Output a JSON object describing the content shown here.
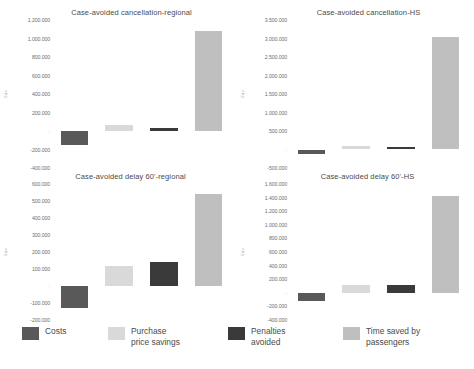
{
  "figure": {
    "ylabel": "Euro",
    "series_names": [
      "Costs",
      "Purchase price savings",
      "Penalties avoided",
      "Time saved by passengers"
    ],
    "colors": {
      "costs": "#595959",
      "purchase_price_savings": "#d9d9d9",
      "penalties_avoided": "#3a3a3a",
      "time_saved_by_passengers": "#bfbfbf"
    }
  },
  "legend": {
    "items": [
      {
        "label": "Costs",
        "color": "#595959"
      },
      {
        "label": "Purchase\nprice savings",
        "color": "#d9d9d9"
      },
      {
        "label": "Penalties\navoided",
        "color": "#3a3a3a"
      },
      {
        "label": "Time saved by\npassengers",
        "color": "#bfbfbf"
      }
    ]
  },
  "chart_data": [
    {
      "id": "cancellation-regional",
      "type": "bar",
      "title": "Case-avoided cancellation-regional",
      "xlabel": "",
      "ylabel": "Euro",
      "categories": [
        "Costs",
        "Purchase price savings",
        "Penalties avoided",
        "Time saved by passengers"
      ],
      "values": [
        -150000,
        60000,
        35000,
        1080000
      ],
      "ylim": [
        -400000,
        1200000
      ],
      "yticks": [
        1200000,
        1000000,
        800000,
        600000,
        400000,
        200000,
        0,
        -200000,
        -400000
      ],
      "ytick_labels": [
        "1.200.000",
        "1.000.000",
        "800.000",
        "600.000",
        "400.000",
        "200.000",
        "-",
        "-200.000",
        "-400.000"
      ],
      "grid": false,
      "legend_position": "below figure"
    },
    {
      "id": "cancellation-hs",
      "type": "bar",
      "title": "Case-avoided cancellation-HS",
      "xlabel": "",
      "ylabel": "Euro",
      "categories": [
        "Costs",
        "Purchase price savings",
        "Penalties avoided",
        "Time saved by passengers"
      ],
      "values": [
        -130000,
        90000,
        60000,
        3050000
      ],
      "ylim": [
        -500000,
        3500000
      ],
      "yticks": [
        3500000,
        3000000,
        2500000,
        2000000,
        1500000,
        1000000,
        500000,
        0,
        -500000
      ],
      "ytick_labels": [
        "3.500.000",
        "3.000.000",
        "2.500.000",
        "2.000.000",
        "1.500.000",
        "1.000.000",
        "500.000",
        "-",
        "-500.000"
      ],
      "grid": false,
      "legend_position": "below figure"
    },
    {
      "id": "delay-60-regional",
      "type": "bar",
      "title": "Case-avoided delay 60'-regional",
      "xlabel": "",
      "ylabel": "Euro",
      "categories": [
        "Costs",
        "Purchase price savings",
        "Penalties avoided",
        "Time saved by passengers"
      ],
      "values": [
        -130000,
        115000,
        140000,
        540000
      ],
      "ylim": [
        -200000,
        600000
      ],
      "yticks": [
        600000,
        500000,
        400000,
        300000,
        200000,
        100000,
        0,
        -100000,
        -200000
      ],
      "ytick_labels": [
        "600.000",
        "500.000",
        "400.000",
        "300.000",
        "200.000",
        "100.000",
        "-",
        "-100.000",
        "-200.000"
      ],
      "grid": false,
      "legend_position": "below figure"
    },
    {
      "id": "delay-60-hs",
      "type": "bar",
      "title": "Case-avoided delay 60'-HS",
      "xlabel": "",
      "ylabel": "Euro",
      "categories": [
        "Costs",
        "Purchase price savings",
        "Penalties avoided",
        "Time saved by passengers"
      ],
      "values": [
        -120000,
        110000,
        120000,
        1430000
      ],
      "ylim": [
        -400000,
        1600000
      ],
      "yticks": [
        1600000,
        1400000,
        1200000,
        1000000,
        800000,
        600000,
        400000,
        200000,
        0,
        -200000,
        -400000
      ],
      "ytick_labels": [
        "1.600.000",
        "1.400.000",
        "1.200.000",
        "1.000.000",
        "800.000",
        "600.000",
        "400.000",
        "200.000",
        "-",
        "-200.000",
        "-400.000"
      ],
      "grid": false,
      "legend_position": "below figure"
    }
  ]
}
